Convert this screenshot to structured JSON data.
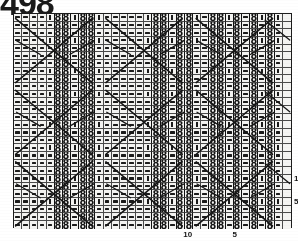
{
  "page": {
    "number": "498",
    "document_type": "knitting-stitch-chart"
  },
  "chart_data": {
    "type": "table",
    "rows": 28,
    "columns": 34,
    "symbols": {
      "dash": "purl stitch",
      "bar": "knit stitch",
      "eight": "twisted / bobble stitch",
      "blank": "no stitch",
      "diagonal": "cable travelling stitch line"
    },
    "row_numbers_visible": [
      "1",
      "5"
    ],
    "column_numbers_visible": [
      "5",
      "10"
    ],
    "grid": [
      "dddd|b|e|e|b|ddddd|b|e|e|b|dddd|e|e|dd|e|d|e|b",
      "dddd|b|e|e|b|ddddd|b|e|e|b|dddd|e|e|dd|e|d|e|b",
      "dddd|b|e|e|b|ddddd|b|e|e|b|dddd|e|e|dd|e|d|e|b",
      "dddd|b|e|e|b|ddddd|b|e|e|b|dddd|e|e|dd|e|d|e|b"
    ],
    "legend_note": "Chart shows repeating cable/lace motif with diagonal travelling-stitch lines crossing the grid"
  },
  "margins": {
    "bottom_labels": [
      "10",
      "5"
    ],
    "right_labels": [
      "1",
      "5"
    ]
  },
  "colors": {
    "ink": "#151515",
    "grid_line": "#4a4a4a",
    "frame": "#1c1c1c",
    "cell_fill": "#f4f4f2",
    "paper": "#ffffff"
  }
}
